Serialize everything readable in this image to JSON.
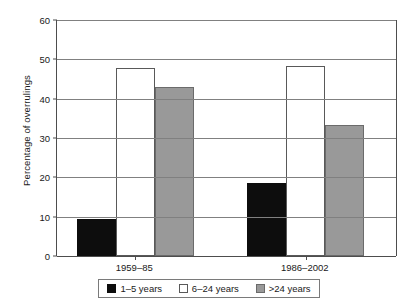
{
  "chart_data": {
    "type": "bar",
    "title": "",
    "subtitle": "",
    "xlabel": "",
    "ylabel": "Percentage of overrulings",
    "categories": [
      "1959–85",
      "1986–2002"
    ],
    "series": [
      {
        "name": "1–5 years",
        "values": [
          9.3,
          18.6
        ],
        "color": "#0d0d0d"
      },
      {
        "name": "6–24 years",
        "values": [
          47.7,
          48.2
        ],
        "color": "#ffffff"
      },
      {
        "name": ">24 years",
        "values": [
          43.0,
          33.3
        ],
        "color": "#999999"
      }
    ],
    "ylim": [
      0,
      60
    ],
    "yticks": [
      0,
      10,
      20,
      30,
      40,
      50,
      60
    ],
    "ytick_labels": [
      "0",
      "10",
      "20",
      "30",
      "40",
      "50",
      "60"
    ],
    "grid": "horizontal",
    "legend_position": "bottom"
  },
  "axes": {
    "y_title": "Percentage of overrulings"
  },
  "legend": {
    "entries": [
      {
        "label": "1–5 years"
      },
      {
        "label": "6–24 years"
      },
      {
        "label": ">24 years"
      }
    ]
  }
}
